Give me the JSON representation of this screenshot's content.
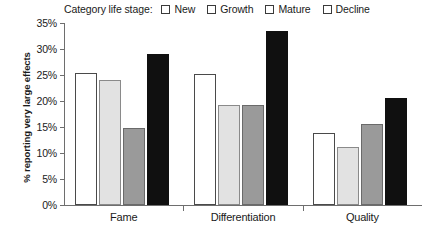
{
  "legend": {
    "title": "Category life stage:",
    "entries": [
      {
        "label": "New",
        "color": "#ffffff"
      },
      {
        "label": "Growth",
        "color": "#e2e2e2"
      },
      {
        "label": "Mature",
        "color": "#9a9a9a"
      },
      {
        "label": "Decline",
        "color": "#101010"
      }
    ]
  },
  "axis": {
    "y_title": "% reporting very large effects",
    "y_ticks": [
      "0%",
      "5%",
      "10%",
      "15%",
      "20%",
      "25%",
      "30%",
      "35%"
    ]
  },
  "chart_data": {
    "type": "bar",
    "title": "",
    "xlabel": "",
    "ylabel": "% reporting very large effects",
    "categories": [
      "Fame",
      "Differentiation",
      "Quality"
    ],
    "series": [
      {
        "name": "New",
        "values": [
          25.3,
          25.2,
          13.8
        ],
        "color": "#ffffff"
      },
      {
        "name": "Growth",
        "values": [
          24.1,
          19.3,
          11.2
        ],
        "color": "#e2e2e2"
      },
      {
        "name": "Mature",
        "values": [
          14.9,
          19.3,
          15.6
        ],
        "color": "#9a9a9a"
      },
      {
        "name": "Decline",
        "values": [
          29.1,
          33.4,
          20.6
        ],
        "color": "#101010"
      }
    ],
    "ylim": [
      0,
      35
    ],
    "ytick_values": [
      0,
      5,
      10,
      15,
      20,
      25,
      30,
      35
    ],
    "ytick_suffix": "%",
    "grid": false,
    "legend_position": "top",
    "legend_title": "Category life stage:"
  }
}
